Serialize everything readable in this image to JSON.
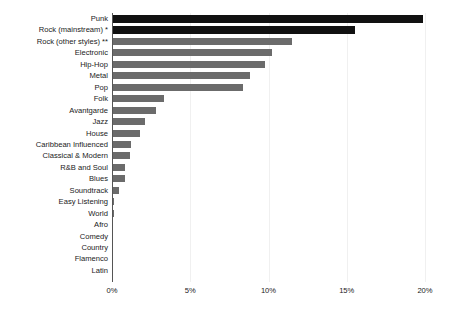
{
  "chart_data": {
    "type": "bar",
    "orientation": "horizontal",
    "title": "",
    "subtitle": "",
    "xlabel": "",
    "ylabel": "",
    "xlim": [
      0,
      20
    ],
    "xtick_values": [
      0,
      5,
      10,
      15,
      20
    ],
    "xtick_labels": [
      "0%",
      "5%",
      "10%",
      "15%",
      "20%"
    ],
    "grid": "vertical-light",
    "legend": "none",
    "value_unit": "percent",
    "categories": [
      "Punk",
      "Rock (mainstream) *",
      "Rock (other styles) **",
      "Electronic",
      "Hip-Hop",
      "Metal",
      "Pop",
      "Folk",
      "Avantgarde",
      "Jazz",
      "House",
      "Caribbean Influenced",
      "Classical & Modern",
      "R&B and Soul",
      "Blues",
      "Soundtrack",
      "Easy Listening",
      "World",
      "Afro",
      "Comedy",
      "Country",
      "Flamenco",
      "Latin"
    ],
    "values": [
      19.9,
      15.5,
      11.5,
      10.2,
      9.8,
      8.8,
      8.4,
      3.3,
      2.8,
      2.1,
      1.8,
      1.2,
      1.15,
      0.85,
      0.85,
      0.45,
      0.15,
      0.15,
      0.0,
      0.0,
      0.0,
      0.0,
      0.0
    ],
    "bar_colors": [
      "#111111",
      "#111111",
      "#6b6b6b",
      "#6b6b6b",
      "#6b6b6b",
      "#6b6b6b",
      "#6b6b6b",
      "#6b6b6b",
      "#6b6b6b",
      "#6b6b6b",
      "#6b6b6b",
      "#6b6b6b",
      "#6b6b6b",
      "#6b6b6b",
      "#6b6b6b",
      "#6b6b6b",
      "#6b6b6b",
      "#6b6b6b",
      "#6b6b6b",
      "#6b6b6b",
      "#6b6b6b",
      "#6b6b6b",
      "#6b6b6b"
    ],
    "colors": {
      "highlight": "#111111",
      "bar": "#6b6b6b",
      "axis": "#555555",
      "grid": "#f0f0f0",
      "text": "#1a1a1a",
      "background": "#ffffff"
    }
  }
}
